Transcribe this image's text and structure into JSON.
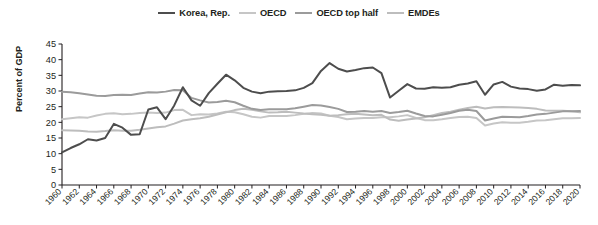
{
  "chart_data": {
    "type": "line",
    "title": "",
    "xlabel": "",
    "ylabel": "Percent of GDP",
    "ylim": [
      0,
      45
    ],
    "ytick_step": 5,
    "xlim": [
      1960,
      2020
    ],
    "xtick_step": 2,
    "grid": false,
    "legend_position": "top-center",
    "yticks": [
      "0",
      "5",
      "10",
      "15",
      "20",
      "25",
      "30",
      "35",
      "40",
      "45"
    ],
    "x": [
      1960,
      1961,
      1962,
      1963,
      1964,
      1965,
      1966,
      1967,
      1968,
      1969,
      1970,
      1971,
      1972,
      1973,
      1974,
      1975,
      1976,
      1977,
      1978,
      1979,
      1980,
      1981,
      1982,
      1983,
      1984,
      1985,
      1986,
      1987,
      1988,
      1989,
      1990,
      1991,
      1992,
      1993,
      1994,
      1995,
      1996,
      1997,
      1998,
      1999,
      2000,
      2001,
      2002,
      2003,
      2004,
      2005,
      2006,
      2007,
      2008,
      2009,
      2010,
      2011,
      2012,
      2013,
      2014,
      2015,
      2016,
      2017,
      2018,
      2019,
      2020
    ],
    "xticks": [
      "1960",
      "1962",
      "1964",
      "1966",
      "1968",
      "1970",
      "1972",
      "1974",
      "1976",
      "1978",
      "1980",
      "1982",
      "1984",
      "1986",
      "1988",
      "1990",
      "1992",
      "1994",
      "1996",
      "1998",
      "2000",
      "2002",
      "2004",
      "2006",
      "2008",
      "2010",
      "2012",
      "2014",
      "2016",
      "2018",
      "2020"
    ],
    "series": [
      {
        "name": "Korea, Rep.",
        "color": "#4d4d4d",
        "width": 2.0,
        "values": [
          10.4,
          11.8,
          13.0,
          14.6,
          14.2,
          15.0,
          19.5,
          18.3,
          16.0,
          16.2,
          24.1,
          24.8,
          21.0,
          25.4,
          31.2,
          27.0,
          25.3,
          29.3,
          32.3,
          35.2,
          33.4,
          31.0,
          29.8,
          29.3,
          29.8,
          29.9,
          30.0,
          30.2,
          31.0,
          32.5,
          36.4,
          38.9,
          37.1,
          36.2,
          36.7,
          37.3,
          37.5,
          35.7,
          27.9,
          30.1,
          32.2,
          30.8,
          30.7,
          31.2,
          31.0,
          31.2,
          32.0,
          32.4,
          33.1,
          28.8,
          32.1,
          32.9,
          31.4,
          30.8,
          30.6,
          30.1,
          30.5,
          32.0,
          31.7,
          31.9,
          31.8
        ]
      },
      {
        "name": "OECD",
        "color": "#c6c6c6",
        "width": 2.0,
        "values": [
          21.0,
          21.3,
          21.6,
          21.5,
          22.2,
          22.7,
          22.9,
          22.6,
          22.7,
          23.0,
          23.1,
          23.0,
          23.1,
          23.9,
          24.0,
          22.3,
          22.6,
          22.5,
          22.8,
          23.4,
          23.2,
          22.6,
          21.8,
          21.5,
          22.0,
          22.0,
          22.0,
          22.3,
          22.7,
          23.0,
          22.8,
          22.1,
          21.7,
          21.0,
          21.2,
          21.4,
          21.4,
          21.6,
          21.6,
          21.9,
          22.3,
          21.4,
          20.7,
          20.7,
          21.0,
          21.4,
          21.7,
          21.8,
          21.4,
          19.0,
          19.6,
          20.0,
          19.9,
          19.9,
          20.2,
          20.6,
          20.7,
          21.0,
          21.3,
          21.3,
          21.4
        ]
      },
      {
        "name": "OECD top half",
        "color": "#9b9b9b",
        "width": 2.0,
        "values": [
          29.8,
          29.6,
          29.3,
          28.9,
          28.5,
          28.4,
          28.7,
          28.8,
          28.7,
          29.2,
          29.6,
          29.5,
          29.8,
          30.3,
          30.2,
          27.8,
          27.0,
          26.3,
          26.5,
          26.9,
          26.4,
          25.3,
          24.3,
          23.9,
          24.2,
          24.2,
          24.2,
          24.5,
          25.0,
          25.5,
          25.4,
          24.9,
          24.3,
          23.3,
          23.4,
          23.6,
          23.4,
          23.6,
          23.0,
          23.3,
          23.7,
          22.8,
          22.0,
          21.9,
          22.4,
          23.0,
          23.7,
          24.0,
          23.6,
          20.6,
          21.2,
          21.8,
          21.7,
          21.6,
          22.0,
          22.5,
          22.7,
          23.1,
          23.5,
          23.5,
          23.6
        ]
      },
      {
        "name": "EMDEs",
        "color": "#bdbdbd",
        "width": 2.0,
        "values": [
          17.5,
          17.4,
          17.3,
          17.1,
          17.0,
          17.2,
          17.5,
          17.3,
          17.3,
          17.6,
          18.0,
          18.4,
          18.7,
          19.6,
          20.6,
          21.0,
          21.3,
          21.8,
          22.5,
          23.2,
          23.9,
          24.3,
          24.0,
          23.5,
          23.1,
          23.2,
          23.4,
          23.1,
          22.8,
          22.6,
          22.4,
          22.1,
          22.3,
          22.6,
          22.7,
          22.5,
          22.3,
          22.4,
          20.9,
          20.5,
          20.9,
          21.2,
          21.6,
          22.3,
          23.0,
          23.4,
          24.0,
          24.6,
          25.0,
          24.4,
          24.8,
          24.9,
          24.8,
          24.7,
          24.6,
          24.3,
          23.8,
          23.7,
          23.7,
          23.5,
          23.2
        ]
      }
    ]
  },
  "legend": {
    "items": [
      {
        "label": "Korea, Rep.",
        "color": "#4d4d4d"
      },
      {
        "label": "OECD",
        "color": "#c6c6c6"
      },
      {
        "label": "OECD top half",
        "color": "#9b9b9b"
      },
      {
        "label": "EMDEs",
        "color": "#bdbdbd"
      }
    ]
  },
  "axis": {
    "y_title": "Percent of GDP"
  }
}
